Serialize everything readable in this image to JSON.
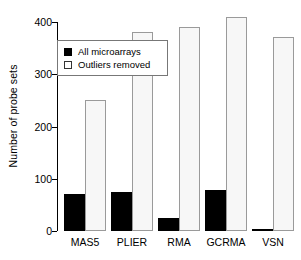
{
  "chart_data": {
    "type": "bar",
    "title": "",
    "subtitle": "",
    "xlabel": "",
    "ylabel": "Number of probe sets",
    "categories": [
      "MAS5",
      "PLIER",
      "RMA",
      "GCRMA",
      "VSN"
    ],
    "series": [
      {
        "name": "All microarrays",
        "style": "filled-black",
        "values": [
          70,
          75,
          25,
          78,
          1
        ]
      },
      {
        "name": "Outliers removed",
        "style": "open-white",
        "values": [
          250,
          380,
          390,
          410,
          372
        ]
      }
    ],
    "ylim": [
      0,
      420
    ],
    "yticks": [
      0,
      100,
      200,
      300,
      400
    ],
    "ytick_labels": [
      "0",
      "100",
      "200",
      "300",
      "400"
    ],
    "grid": false,
    "legend_position": "upper-left-inside",
    "legend_entries": [
      "All microarrays",
      "Outliers removed"
    ]
  },
  "colors": {
    "series_all_microarrays": "#000000",
    "series_outliers_removed": "#f7f7f7",
    "bar_border": "#9a9a9a",
    "axis": "#000000",
    "background": "#ffffff",
    "legend_border": "#777777"
  }
}
